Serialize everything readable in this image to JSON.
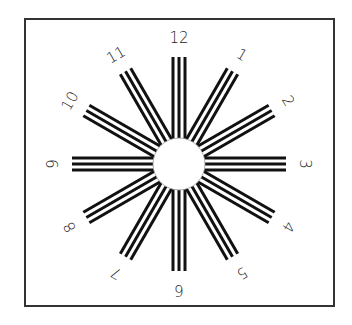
{
  "diagram": {
    "type": "astigmatism-clock-dial",
    "frame": {
      "x": 25,
      "y": 19,
      "width": 309,
      "height": 287,
      "stroke": "#333333"
    },
    "center": {
      "x": 179,
      "y": 164
    },
    "hub_radius": 26,
    "line_outer_radius": 107,
    "label_radius": 126,
    "lines_per_spoke": 3,
    "line_spacing": 6,
    "line_color": "#111111",
    "spokes": [
      {
        "label": "12",
        "hour": 12
      },
      {
        "label": "1",
        "hour": 1
      },
      {
        "label": "2",
        "hour": 2
      },
      {
        "label": "3",
        "hour": 3
      },
      {
        "label": "4",
        "hour": 4
      },
      {
        "label": "5",
        "hour": 5
      },
      {
        "label": "6",
        "hour": 6
      },
      {
        "label": "7",
        "hour": 7
      },
      {
        "label": "8",
        "hour": 8
      },
      {
        "label": "9",
        "hour": 9
      },
      {
        "label": "10",
        "hour": 10
      },
      {
        "label": "11",
        "hour": 11
      }
    ]
  }
}
